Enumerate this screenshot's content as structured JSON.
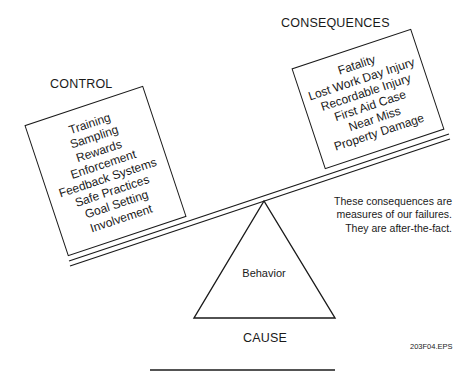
{
  "diagram": {
    "control": {
      "title": "CONTROL",
      "items": [
        "Training",
        "Sampling",
        "Rewards",
        "Enforcement",
        "Feedback Systems",
        "Safe Practices",
        "Goal Setting",
        "Involvement"
      ]
    },
    "consequences": {
      "title": "CONSEQUENCES",
      "items": [
        "Fatality",
        "Lost Work Day Injury",
        "Recordable Injury",
        "First Aid Case",
        "Near Miss",
        "Property Damage"
      ]
    },
    "note": {
      "lines": [
        "These consequences are",
        "measures of our failures.",
        "They are after-the-fact."
      ]
    },
    "fulcrum": {
      "label": "Behavior",
      "caption": "CAUSE"
    },
    "figure_id": "203F04.EPS",
    "colors": {
      "ink": "#1a1a1a",
      "background": "#ffffff"
    }
  }
}
